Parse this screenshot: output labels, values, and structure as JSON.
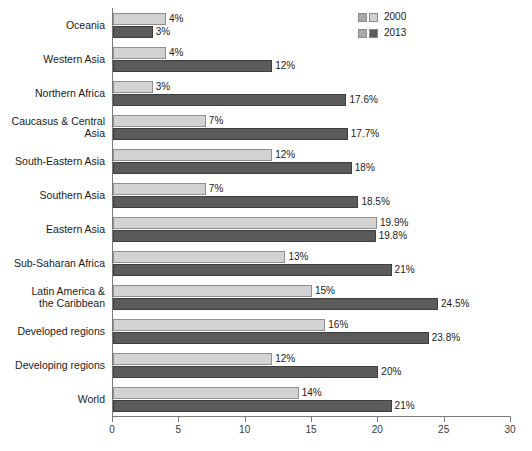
{
  "chart_data": {
    "type": "bar",
    "orientation": "horizontal",
    "title": "",
    "subtitle": "",
    "xlabel": "",
    "ylabel": "",
    "xlim": [
      0,
      30
    ],
    "grid": false,
    "legend_position": "top-right",
    "tick_labels": [
      "0",
      "5",
      "10",
      "15",
      "20",
      "25",
      "30"
    ],
    "tick_values": [
      0,
      5,
      10,
      15,
      20,
      25,
      30
    ],
    "categories": [
      "Oceania",
      "Western Asia",
      "Northern Africa",
      "Caucasus & Central\nAsia",
      "South-Eastern Asia",
      "Southern Asia",
      "Eastern Asia",
      "Sub-Saharan Africa",
      "Latin America &\nthe Caribbean",
      "Developed regions",
      "Developing regions",
      "World"
    ],
    "series": [
      {
        "name": "2000",
        "color": "#d2d2d2",
        "values": [
          4,
          4,
          3,
          7,
          12,
          7,
          19.9,
          13,
          15,
          16,
          12,
          14
        ],
        "labels": [
          "4%",
          "4%",
          "3%",
          "7%",
          "12%",
          "7%",
          "19.9%",
          "13%",
          "15%",
          "16%",
          "12%",
          "14%"
        ]
      },
      {
        "name": "2013",
        "color": "#5b5b5b",
        "values": [
          3,
          12,
          17.6,
          17.7,
          18,
          18.5,
          19.8,
          21,
          24.5,
          23.8,
          20,
          21
        ],
        "labels": [
          "3%",
          "12%",
          "17.6%",
          "17.7%",
          "18%",
          "18.5%",
          "19.8%",
          "21%",
          "24.5%",
          "23.8%",
          "20%",
          "21%"
        ]
      }
    ]
  },
  "legend": {
    "items": [
      {
        "label": "2000"
      },
      {
        "label": "2013"
      }
    ]
  }
}
